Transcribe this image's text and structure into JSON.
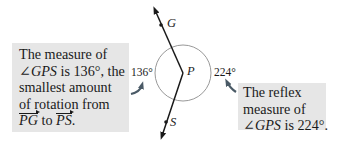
{
  "diagram": {
    "points": {
      "G": "G",
      "P": "P",
      "S": "S"
    },
    "angle_labels": {
      "small": "136°",
      "reflex": "224°"
    },
    "colors": {
      "callout_bg": "#e6e6e6",
      "ink": "#1a1a1a",
      "circle": "#8c8c8c",
      "pointer": "#4a5a66"
    }
  },
  "left_callout": {
    "line1": "The measure of",
    "line2_angle": "∠GPS",
    "line2_rest": " is 136°, the",
    "line3": "smallest amount",
    "line4": "of rotation from",
    "ray1": "PG",
    "line5_mid": " to ",
    "ray2": "PS",
    "line5_end": "."
  },
  "right_callout": {
    "line1": "The reflex",
    "line2": "measure of",
    "line3_angle": "∠GPS",
    "line3_rest": " is 224°."
  }
}
